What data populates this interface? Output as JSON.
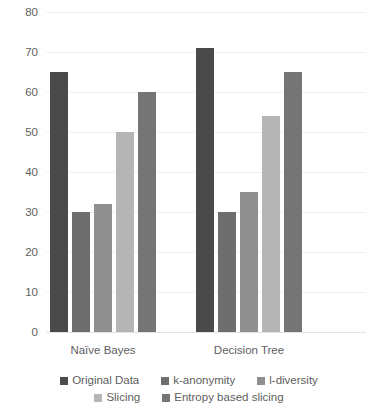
{
  "chart_data": {
    "type": "bar",
    "title": "",
    "xlabel": "",
    "ylabel": "",
    "categories": [
      "Naïve Bayes",
      "Decision Tree"
    ],
    "series": [
      {
        "name": "Original Data",
        "color": "#4a4a4a",
        "values": [
          65,
          71
        ]
      },
      {
        "name": "k-anonymity",
        "color": "#6e6e6e",
        "values": [
          30,
          30
        ]
      },
      {
        "name": "l-diversity",
        "color": "#8f8f8f",
        "values": [
          32,
          35
        ]
      },
      {
        "name": "Slicing",
        "color": "#b5b5b5",
        "values": [
          50,
          54
        ]
      },
      {
        "name": "Entropy based slicing",
        "color": "#757575",
        "values": [
          60,
          65
        ]
      }
    ],
    "ylim": [
      0,
      80
    ],
    "ytick_step": 10,
    "yticks": [
      "0",
      "10",
      "20",
      "30",
      "40",
      "50",
      "60",
      "70",
      "80"
    ],
    "grid": true,
    "legend_position": "bottom",
    "legend_rows": [
      [
        "Original Data",
        "k-anonymity",
        "l-diversity"
      ],
      [
        "Slicing",
        "Entropy based slicing"
      ]
    ]
  }
}
